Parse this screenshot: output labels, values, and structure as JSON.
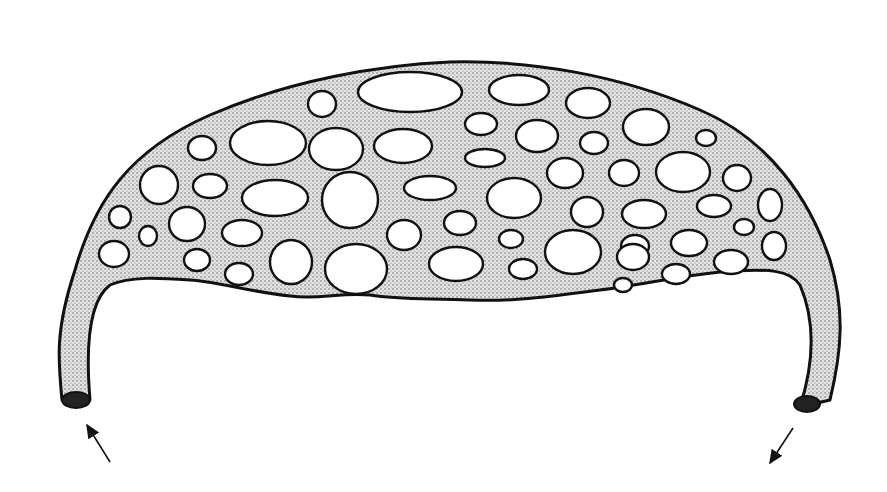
{
  "figure": {
    "colors": {
      "background": "#ffffff",
      "outline": "#111111",
      "stipple_fill": "#d6d6d6",
      "hole_fill": "#ffffff"
    },
    "body_path": "M 62 400 C 58 360, 55 330, 75 270 C 95 200, 130 150, 210 115 C 290 80, 380 65, 450 62 C 530 60, 620 75, 700 110 C 770 140, 810 200, 830 260 C 845 310, 842 350, 830 400 L 800 407 C 815 360, 815 320, 800 285 C 790 270, 770 268, 720 272 C 680 276, 640 285, 600 290 C 560 295, 520 302, 470 300 C 430 298, 400 300, 370 295 C 340 292, 320 300, 290 296 C 250 292, 220 282, 190 280 C 160 278, 130 276, 110 285 C 90 300, 85 340, 90 400 Z",
    "holes": [
      {
        "cx": 322,
        "cy": 104,
        "rx": 14,
        "ry": 13
      },
      {
        "cx": 410,
        "cy": 92,
        "rx": 52,
        "ry": 20
      },
      {
        "cx": 519,
        "cy": 90,
        "rx": 30,
        "ry": 15
      },
      {
        "cx": 588,
        "cy": 103,
        "rx": 22,
        "ry": 15
      },
      {
        "cx": 646,
        "cy": 127,
        "rx": 23,
        "ry": 18
      },
      {
        "cx": 706,
        "cy": 138,
        "rx": 10,
        "ry": 8
      },
      {
        "cx": 202,
        "cy": 148,
        "rx": 14,
        "ry": 12
      },
      {
        "cx": 268,
        "cy": 143,
        "rx": 38,
        "ry": 22
      },
      {
        "cx": 336,
        "cy": 149,
        "rx": 27,
        "ry": 21
      },
      {
        "cx": 403,
        "cy": 146,
        "rx": 29,
        "ry": 17
      },
      {
        "cx": 481,
        "cy": 124,
        "rx": 16,
        "ry": 11
      },
      {
        "cx": 537,
        "cy": 136,
        "rx": 21,
        "ry": 16
      },
      {
        "cx": 594,
        "cy": 143,
        "rx": 14,
        "ry": 11
      },
      {
        "cx": 485,
        "cy": 158,
        "rx": 20,
        "ry": 9
      },
      {
        "cx": 565,
        "cy": 173,
        "rx": 18,
        "ry": 15
      },
      {
        "cx": 624,
        "cy": 173,
        "rx": 15,
        "ry": 13
      },
      {
        "cx": 683,
        "cy": 172,
        "rx": 27,
        "ry": 20
      },
      {
        "cx": 737,
        "cy": 178,
        "rx": 14,
        "ry": 13
      },
      {
        "cx": 159,
        "cy": 185,
        "rx": 19,
        "ry": 19
      },
      {
        "cx": 210,
        "cy": 186,
        "rx": 17,
        "ry": 12
      },
      {
        "cx": 275,
        "cy": 198,
        "rx": 33,
        "ry": 18
      },
      {
        "cx": 350,
        "cy": 200,
        "rx": 28,
        "ry": 28
      },
      {
        "cx": 430,
        "cy": 188,
        "rx": 26,
        "ry": 12
      },
      {
        "cx": 514,
        "cy": 198,
        "rx": 27,
        "ry": 20
      },
      {
        "cx": 587,
        "cy": 212,
        "rx": 16,
        "ry": 15
      },
      {
        "cx": 644,
        "cy": 214,
        "rx": 22,
        "ry": 14
      },
      {
        "cx": 714,
        "cy": 206,
        "rx": 17,
        "ry": 11
      },
      {
        "cx": 770,
        "cy": 205,
        "rx": 12,
        "ry": 16
      },
      {
        "cx": 120,
        "cy": 217,
        "rx": 11,
        "ry": 11
      },
      {
        "cx": 148,
        "cy": 236,
        "rx": 9,
        "ry": 10
      },
      {
        "cx": 187,
        "cy": 224,
        "rx": 18,
        "ry": 17
      },
      {
        "cx": 242,
        "cy": 233,
        "rx": 20,
        "ry": 13
      },
      {
        "cx": 404,
        "cy": 235,
        "rx": 17,
        "ry": 15
      },
      {
        "cx": 460,
        "cy": 223,
        "rx": 16,
        "ry": 12
      },
      {
        "cx": 511,
        "cy": 239,
        "rx": 12,
        "ry": 9
      },
      {
        "cx": 573,
        "cy": 252,
        "rx": 28,
        "ry": 22
      },
      {
        "cx": 635,
        "cy": 246,
        "rx": 14,
        "ry": 11
      },
      {
        "cx": 689,
        "cy": 243,
        "rx": 18,
        "ry": 13
      },
      {
        "cx": 744,
        "cy": 227,
        "rx": 10,
        "ry": 8
      },
      {
        "cx": 774,
        "cy": 246,
        "rx": 12,
        "ry": 14
      },
      {
        "cx": 114,
        "cy": 254,
        "rx": 15,
        "ry": 13
      },
      {
        "cx": 197,
        "cy": 260,
        "rx": 13,
        "ry": 11
      },
      {
        "cx": 291,
        "cy": 262,
        "rx": 21,
        "ry": 22
      },
      {
        "cx": 356,
        "cy": 269,
        "rx": 31,
        "ry": 25
      },
      {
        "cx": 456,
        "cy": 264,
        "rx": 27,
        "ry": 17
      },
      {
        "cx": 523,
        "cy": 269,
        "rx": 14,
        "ry": 10
      },
      {
        "cx": 633,
        "cy": 257,
        "rx": 16,
        "ry": 13
      },
      {
        "cx": 676,
        "cy": 274,
        "rx": 14,
        "ry": 10
      },
      {
        "cx": 731,
        "cy": 262,
        "rx": 17,
        "ry": 12
      },
      {
        "cx": 239,
        "cy": 274,
        "rx": 14,
        "ry": 11
      },
      {
        "cx": 623,
        "cy": 285,
        "rx": 9,
        "ry": 7
      }
    ],
    "left_tube_end": {
      "cx": 76,
      "cy": 400,
      "rx": 14,
      "ry": 8
    },
    "right_tube_end": {
      "cx": 807,
      "cy": 404,
      "rx": 13,
      "ry": 8
    },
    "arrows": [
      {
        "name": "inflow-arrow",
        "from": [
          110,
          462
        ],
        "to": [
          87,
          425
        ]
      },
      {
        "name": "outflow-arrow",
        "from": [
          793,
          428
        ],
        "to": [
          770,
          463
        ]
      }
    ]
  }
}
